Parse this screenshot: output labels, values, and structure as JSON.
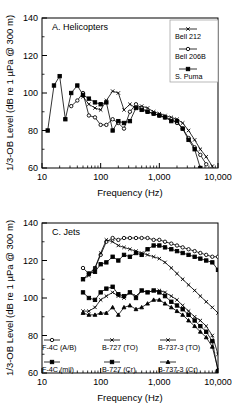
{
  "figure": {
    "background": "#ffffff",
    "ink": "#000000"
  },
  "chart_data": [
    {
      "type": "line",
      "panel_id": "A",
      "title": "A.  Helicopters",
      "xlabel": "Frequency (Hz)",
      "ylabel": "1/3-OB Level (dB re 1 µPa @ 300 m)",
      "xscale": "log",
      "xlim": [
        10,
        10000
      ],
      "ylim": [
        60,
        140
      ],
      "xticks": [
        10,
        100,
        1000,
        10000
      ],
      "xticklabels": [
        "10",
        "100",
        "1,000",
        "10,000"
      ],
      "yticks": [
        60,
        80,
        100,
        120,
        140
      ],
      "yticklabels": [
        "60",
        "80",
        "100",
        "120",
        "140"
      ],
      "yminorticks": [
        70,
        90,
        110,
        130
      ],
      "grid": false,
      "legend_position": "top-right",
      "series": [
        {
          "name": "Bell 212",
          "marker": "x",
          "marker_fill": "none",
          "color": "#000000",
          "x": [
            50,
            63,
            80,
            100,
            125,
            160,
            200,
            250,
            315,
            400,
            500,
            630,
            800,
            1000,
            1250,
            1600,
            2000,
            2500,
            3150,
            4000,
            5000,
            6300,
            8000
          ],
          "y": [
            98,
            94,
            92,
            91,
            96,
            101,
            100,
            91,
            94,
            92,
            93,
            92,
            90,
            89,
            88,
            87,
            86,
            84,
            80,
            75,
            70,
            66,
            61
          ]
        },
        {
          "name": "Bell 206B",
          "marker": "circle",
          "marker_fill": "none",
          "color": "#000000",
          "x": [
            31.5,
            40,
            50,
            63,
            80,
            100,
            125,
            160,
            200,
            250,
            315,
            400,
            500,
            630,
            800,
            1000,
            1250,
            1600,
            2000,
            2500,
            3150,
            4000,
            5000,
            6300
          ],
          "y": [
            93,
            96,
            100,
            88,
            87,
            83,
            83,
            86,
            84,
            81,
            90,
            94,
            92,
            90,
            89,
            88,
            87,
            86,
            84,
            81,
            76,
            71,
            67,
            62
          ]
        },
        {
          "name": "S. Puma",
          "marker": "square",
          "marker_fill": "#000000",
          "color": "#000000",
          "x": [
            12.5,
            16,
            20,
            25,
            31.5,
            40,
            50,
            63,
            80,
            100,
            125,
            160,
            200,
            250,
            315,
            400,
            500,
            630,
            800,
            1000,
            1250,
            1600,
            2000,
            2500,
            3150,
            4000,
            5000
          ],
          "y": [
            80,
            104,
            109,
            86,
            100,
            104,
            99,
            97,
            95,
            94,
            95,
            80,
            85,
            84,
            85,
            92,
            91,
            90,
            89,
            88,
            87,
            85,
            85,
            81,
            75,
            70,
            60
          ]
        }
      ]
    },
    {
      "type": "line",
      "panel_id": "C",
      "title": "C.  Jets",
      "xlabel": "Frequency (Hz)",
      "ylabel": "1/3-OB Level (dB re 1 µPa @ 300 m)",
      "xscale": "log",
      "xlim": [
        10,
        10000
      ],
      "ylim": [
        60,
        140
      ],
      "xticks": [
        10,
        100,
        1000,
        10000
      ],
      "xticklabels": [
        "10",
        "100",
        "1,000",
        "10,000"
      ],
      "yticks": [
        60,
        80,
        100,
        120,
        140
      ],
      "yticklabels": [
        "60",
        "80",
        "100",
        "120",
        "140"
      ],
      "yminorticks": [
        70,
        90,
        110,
        130
      ],
      "grid": false,
      "legend_position": "bottom-left",
      "series": [
        {
          "name": "F-4C (A/B)",
          "marker": "circle",
          "marker_fill": "none",
          "color": "#000000",
          "x": [
            50,
            63,
            80,
            100,
            125,
            160,
            200,
            250,
            315,
            400,
            500,
            630,
            800,
            1000,
            1250,
            1600,
            2000,
            2500,
            3150,
            4000,
            5000,
            6300,
            8000,
            10000
          ],
          "y": [
            116,
            113,
            116,
            123,
            130,
            132,
            131,
            132,
            132,
            132,
            132,
            132,
            131,
            131,
            130,
            129,
            128,
            127,
            126,
            125,
            124,
            123,
            122,
            122
          ]
        },
        {
          "name": "F-4C (mil)",
          "marker": "square",
          "marker_fill": "#000000",
          "color": "#000000",
          "x": [
            50,
            63,
            80,
            100,
            125,
            160,
            200,
            250,
            315,
            400,
            500,
            630,
            800,
            1000,
            1250,
            1600,
            2000,
            2500,
            3150,
            4000,
            5000,
            6300,
            8000,
            10000
          ],
          "y": [
            110,
            113,
            114,
            118,
            119,
            122,
            120,
            123,
            122,
            124,
            123,
            126,
            128,
            128,
            127,
            126,
            125,
            124,
            123,
            122,
            121,
            120,
            119,
            115
          ]
        },
        {
          "name": "B-727 (TO)",
          "marker": "x",
          "marker_fill": "none",
          "color": "#000000",
          "x": [
            50,
            63,
            80,
            100,
            125,
            160,
            200,
            250,
            315,
            400,
            500,
            630,
            800,
            1000,
            1250,
            1600,
            2000,
            2500,
            3150,
            4000,
            5000,
            6300,
            8000,
            10000
          ],
          "y": [
            110,
            112,
            116,
            124,
            131,
            130,
            128,
            127,
            126,
            125,
            124,
            123,
            122,
            121,
            119,
            116,
            113,
            110,
            107,
            104,
            101,
            98,
            95,
            92
          ]
        },
        {
          "name": "B-727 (Cr)",
          "marker": "square",
          "marker_fill": "#000000",
          "color": "#000000",
          "x": [
            50,
            63,
            80,
            100,
            125,
            160,
            200,
            250,
            315,
            400,
            500,
            630,
            800,
            1000,
            1250,
            1600,
            2000,
            2500,
            3150,
            4000,
            5000,
            6300,
            8000,
            10000
          ],
          "y": [
            103,
            100,
            99,
            103,
            105,
            106,
            102,
            101,
            103,
            100,
            104,
            103,
            104,
            103,
            101,
            98,
            96,
            94,
            91,
            88,
            85,
            82,
            77,
            61
          ]
        },
        {
          "name": "B-737-3 (TO)",
          "marker": "x",
          "marker_fill": "none",
          "color": "#000000",
          "x": [
            50,
            63,
            80,
            100,
            125,
            160,
            200,
            250,
            315,
            400,
            500,
            630,
            800,
            1000,
            1250,
            1600,
            2000,
            2500,
            3150,
            4000,
            5000,
            6300,
            8000,
            10000
          ],
          "y": [
            93,
            93,
            95,
            99,
            101,
            103,
            101,
            100,
            103,
            101,
            104,
            103,
            104,
            104,
            103,
            101,
            99,
            96,
            93,
            90,
            88,
            85,
            80,
            70
          ]
        },
        {
          "name": "B-737-3 (Cr)",
          "marker": "triangle",
          "marker_fill": "#000000",
          "color": "#000000",
          "x": [
            50,
            63,
            80,
            100,
            125,
            160,
            200,
            250,
            315,
            400,
            500,
            630,
            800,
            1000,
            1250,
            1600,
            2000,
            2500,
            3150,
            4000,
            5000,
            6300,
            8000,
            10000
          ],
          "y": [
            92,
            91,
            91,
            92,
            92,
            95,
            91,
            95,
            96,
            94,
            95,
            97,
            99,
            99,
            97,
            95,
            93,
            91,
            88,
            85,
            82,
            79,
            74,
            62
          ]
        }
      ]
    }
  ]
}
